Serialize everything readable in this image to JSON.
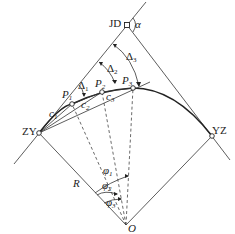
{
  "diagram": {
    "type": "circular-curve-deflection-angle-layout",
    "points": {
      "JD": {
        "label": "JD",
        "x": 127,
        "y": 25
      },
      "ZY": {
        "label": "ZY",
        "x": 39,
        "y": 133
      },
      "YZ": {
        "label": "YZ",
        "x": 212,
        "y": 136
      },
      "O": {
        "label": "O",
        "x": 126,
        "y": 225
      },
      "P1": {
        "label": "P",
        "sub": "1",
        "x": 72,
        "y": 104
      },
      "P2": {
        "label": "P",
        "sub": "2",
        "x": 102,
        "y": 92
      },
      "P3": {
        "label": "P",
        "sub": "3",
        "x": 133,
        "y": 88
      }
    },
    "labels": {
      "alpha": "α",
      "R": "R",
      "delta1": {
        "main": "Δ",
        "sub": "1"
      },
      "delta2": {
        "main": "Δ",
        "sub": "2"
      },
      "delta3": {
        "main": "Δ",
        "sub": "3"
      },
      "c1": {
        "main": "c",
        "sub": "1"
      },
      "c2": {
        "main": "c",
        "sub": "2"
      },
      "c3": {
        "main": "c",
        "sub": "3"
      },
      "phi1": {
        "main": "φ",
        "sub": "1"
      },
      "phi2": {
        "main": "φ",
        "sub": "2"
      },
      "phi3": {
        "main": "φ",
        "sub": "3"
      }
    },
    "colors": {
      "line": "#333333",
      "curve": "#222222",
      "background": "#ffffff"
    }
  }
}
